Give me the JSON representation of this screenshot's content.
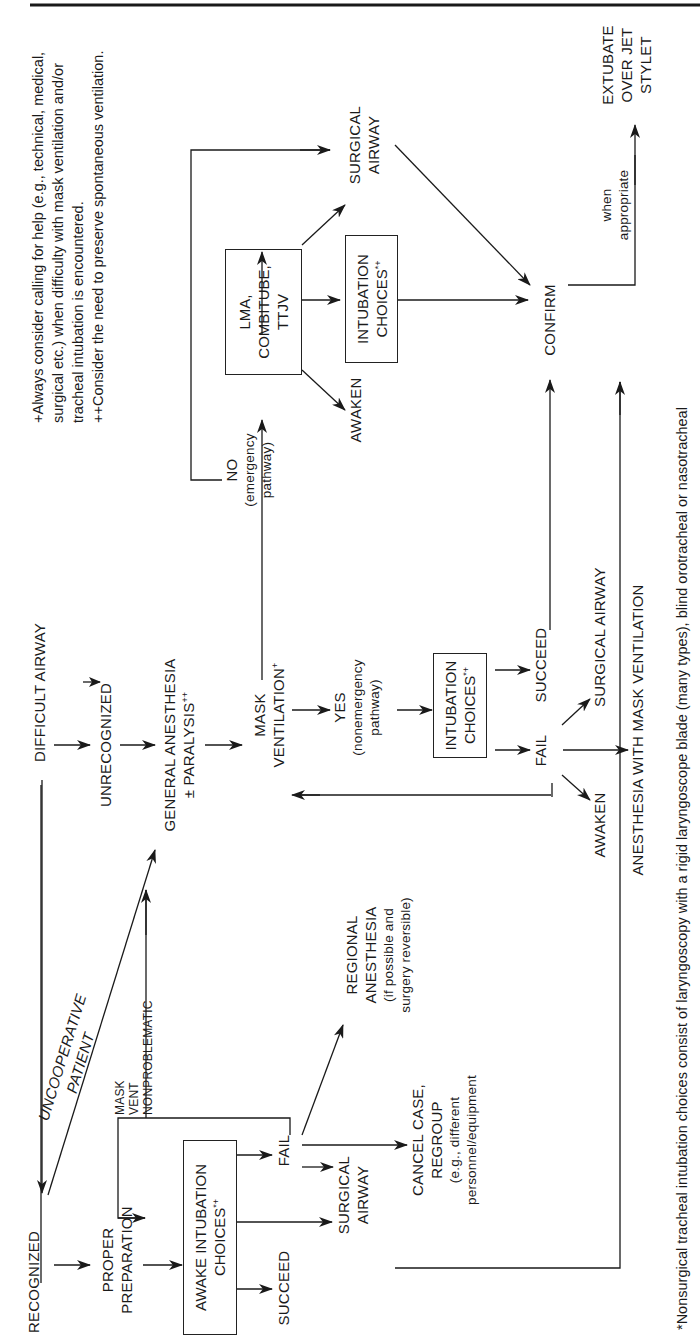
{
  "diagram": {
    "orientation": "rotated 90 degrees counterclockwise",
    "nodes": {
      "recognized": "RECOGNIZED",
      "difficult_airway": "DIFFICULT AIRWAY",
      "unrecognized": "UNRECOGNIZED",
      "general_anesthesia_l1": "GENERAL ANESTHESIA",
      "general_anesthesia_l2": "± PARALYSIS",
      "general_anesthesia_sup": "++",
      "proper_preparation_l1": "PROPER",
      "proper_preparation_l2": "PREPARATION",
      "awake_intubation_l1": "AWAKE INTUBATION",
      "awake_intubation_l2": "CHOICES",
      "awake_intubation_sup": "*+",
      "awake_succeed": "SUCCEED",
      "awake_fail": "FAIL",
      "awake_surgical_airway_l1": "SURGICAL",
      "awake_surgical_airway_l2": "AIRWAY",
      "cancel_case_l1": "CANCEL CASE,",
      "cancel_case_l2": "REGROUP",
      "cancel_case_l3": "(e.g., different",
      "cancel_case_l4": "personnel/equipment",
      "regional_l1": "REGIONAL",
      "regional_l2": "ANESTHESIA",
      "regional_l3": "(if possible and",
      "regional_l4": "surgery reversible)",
      "mask_vent_l1": "MASK",
      "mask_vent_l2": "VENT",
      "mask_vent_l3": "NONPROBLEMATIC",
      "uncooperative_l1": "UNCOOPERATIVE",
      "uncooperative_l2": "PATIENT",
      "mask_ventilation_l1": "MASK",
      "mask_ventilation_l2": "VENTILATION",
      "mask_ventilation_sup": "+",
      "yes": "YES",
      "yes_sub_l1": "(nonemergency",
      "yes_sub_l2": "pathway)",
      "no": "NO",
      "no_sub_l1": "(emergency",
      "no_sub_l2": "pathway)",
      "intubation_choices_l1": "INTUBATION",
      "intubation_choices_l2": "CHOICES",
      "intubation_choices_sup": "*+",
      "ne_succeed": "SUCCEED",
      "ne_fail": "FAIL",
      "ne_awaken": "AWAKEN",
      "ne_surgical_airway": "SURGICAL AIRWAY",
      "ne_anesthesia_mask": "ANESTHESIA WITH MASK VENTILATION",
      "lma_l1": "LMA,",
      "lma_l2": "COMBITUBE,",
      "lma_l3": "TTJV",
      "em_awaken": "AWAKEN",
      "em_intubation_l1": "INTUBATION",
      "em_intubation_l2": "CHOICES",
      "em_intubation_sup": "*+",
      "em_surgical_l1": "SURGICAL",
      "em_surgical_l2": "AIRWAY",
      "confirm": "CONFIRM",
      "when_l1": "when",
      "when_l2": "appropriate",
      "extubate_l1": "EXTUBATE",
      "extubate_l2": "OVER JET",
      "extubate_l3": "STYLET"
    },
    "notes": {
      "plus_l1": "+Always consider calling for help (e.g., technical, medical,",
      "plus_l2": "surgical etc.) when difficulty with mask ventilation and/or",
      "plus_l3": "tracheal intubation is encountered.",
      "plusplus": "++Consider the need to preserve spontaneous ventilation.",
      "footnote": "*Nonsurgical tracheal intubation choices consist of laryngoscopy with a rigid laryngoscope blade (many types), blind orotracheal or nasotracheal"
    },
    "colors": {
      "ink": "#1a1a1a",
      "background": "#ffffff"
    }
  }
}
